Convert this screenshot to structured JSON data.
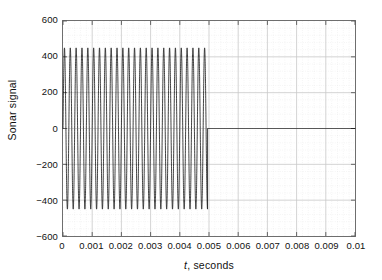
{
  "chart_data": {
    "type": "line",
    "title": "",
    "xlabel_italic": "t",
    "xlabel_rest": ", seconds",
    "xlabel": "t, seconds",
    "ylabel": "Sonar signal",
    "xlim": [
      0,
      0.01
    ],
    "ylim": [
      -600,
      600
    ],
    "xticks": [
      0,
      0.001,
      0.002,
      0.003,
      0.004,
      0.005,
      0.006,
      0.007,
      0.008,
      0.009,
      0.01
    ],
    "xticklabels": [
      "0",
      "0.001",
      "0.002",
      "0.003",
      "0.004",
      "0.005",
      "0.006",
      "0.007",
      "0.008",
      "0.009",
      "0.01"
    ],
    "yticks": [
      -600,
      -400,
      -200,
      0,
      200,
      400,
      600
    ],
    "yticklabels": [
      "-600",
      "-400",
      "-200",
      "0",
      "200",
      "400",
      "600"
    ],
    "grid": true,
    "minor_grid": true,
    "legend": null,
    "series": [
      {
        "name": "Sonar signal",
        "description": "Damped-free sinusoidal burst: amplitude 450 oscillating at about 5000 Hz from t=0 to t=0.00495 s, then identically zero out to t=0.01 s.",
        "amplitude": 450,
        "frequency_hz": 5000,
        "burst_start": 0,
        "burst_end": 0.00495,
        "cycles_in_burst": 25,
        "tail_value": 0,
        "color": "#111111",
        "linewidth": 0.8
      }
    ]
  },
  "style": {
    "background": "#ffffff",
    "frame_color": "#6e6e6e",
    "major_grid_color": "#c9c9c9",
    "minor_grid_color": "#e2e2e2",
    "tick_color": "#555555",
    "text_color": "#111111"
  }
}
